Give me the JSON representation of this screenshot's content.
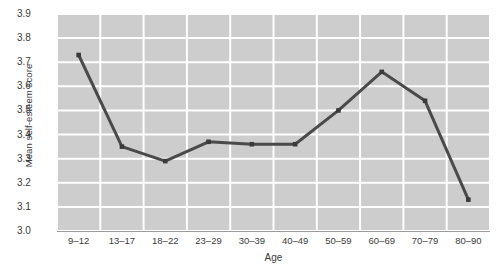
{
  "chart_data": {
    "type": "line",
    "title": "",
    "subtitle": "",
    "xlabel": "Age",
    "ylabel": "Mean self-esteem score",
    "categories": [
      "9–12",
      "13–17",
      "18–22",
      "23–29",
      "30–39",
      "40–49",
      "50–59",
      "60–69",
      "70–79",
      "80–90"
    ],
    "values": [
      3.73,
      3.35,
      3.29,
      3.37,
      3.36,
      3.36,
      3.5,
      3.66,
      3.54,
      3.13
    ],
    "series": [
      {
        "name": "Mean self-esteem score",
        "values": [
          3.73,
          3.35,
          3.29,
          3.37,
          3.36,
          3.36,
          3.5,
          3.66,
          3.54,
          3.13
        ]
      }
    ],
    "ylim": [
      3.0,
      3.9
    ],
    "yticks": [
      3.0,
      3.1,
      3.2,
      3.3,
      3.4,
      3.5,
      3.6,
      3.7,
      3.8,
      3.9
    ],
    "ytick_labels": [
      "3.0",
      "3.1",
      "3.2",
      "3.3",
      "3.4",
      "3.5",
      "3.6",
      "3.7",
      "3.8",
      "3.9"
    ],
    "grid": true,
    "grid_axis": "both",
    "legend": false,
    "legend_position": "none",
    "markers": "square",
    "annotations": []
  },
  "colors": {
    "plot_background": "#cdcdcd",
    "grid_line": "#ffffff",
    "series_line": "#4a4a4a",
    "marker": "#3a3a3a",
    "text": "#3c3c3c",
    "page_background": "#ffffff",
    "axis_line": "#9a9a9a"
  }
}
